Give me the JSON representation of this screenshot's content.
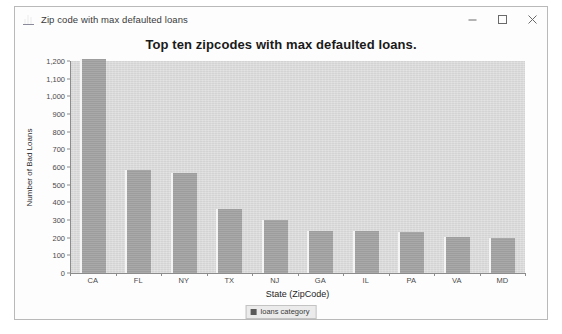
{
  "window": {
    "title": "Zip code with max defaulted loans",
    "icon": "chart-icon",
    "controls": {
      "minimize": "minimize-button",
      "maximize": "maximize-button",
      "close": "close-button"
    }
  },
  "chart_data": {
    "type": "bar",
    "title": "Top ten zipcodes with max defaulted loans.",
    "xlabel": "State (ZipCode)",
    "ylabel": "Number of Bad Loans",
    "categories": [
      "CA",
      "FL",
      "NY",
      "TX",
      "NJ",
      "GA",
      "IL",
      "PA",
      "VA",
      "MD"
    ],
    "values": [
      1210,
      585,
      565,
      360,
      300,
      240,
      235,
      230,
      205,
      200
    ],
    "series": [
      {
        "name": "loans category",
        "values": [
          1210,
          585,
          565,
          360,
          300,
          240,
          235,
          230,
          205,
          200
        ]
      }
    ],
    "ylim": [
      0,
      1200
    ],
    "ytick_labels": [
      "1,200",
      "1,100",
      "1,000",
      "900",
      "800",
      "700",
      "600",
      "500",
      "400",
      "300",
      "200",
      "100",
      "0"
    ],
    "ytick_values": [
      1200,
      1100,
      1000,
      900,
      800,
      700,
      600,
      500,
      400,
      300,
      200,
      100,
      0
    ],
    "ytick_step": 100,
    "grid": false,
    "legend": {
      "position": "bottom-center",
      "entries": [
        "loans category"
      ]
    },
    "colors": {
      "bar_fill": "#a2a2a2",
      "bar_highlight": "#f4f4f4",
      "plot_background": "#d9d9d9",
      "axis": "#8c8c8c",
      "text": "#1f1f1f",
      "window_background": "#fdfdfd"
    }
  }
}
